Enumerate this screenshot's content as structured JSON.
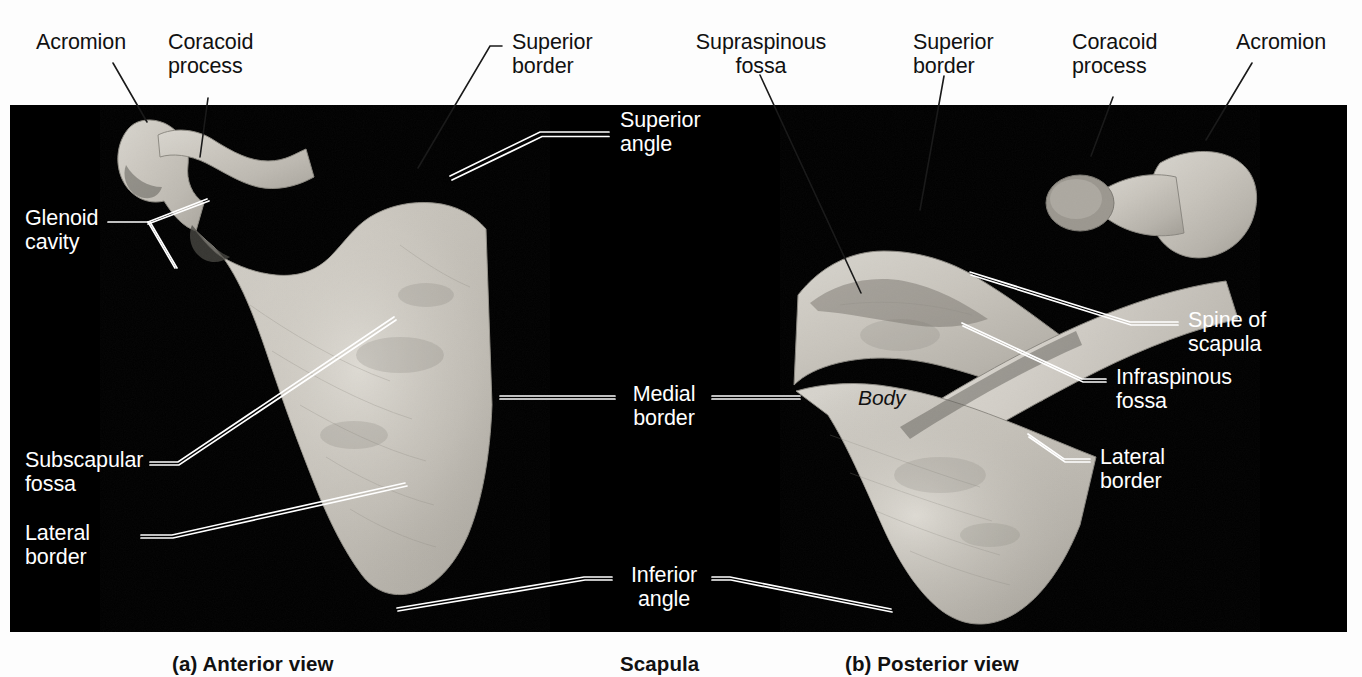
{
  "figure": {
    "title": "Scapula",
    "background_color": "#fdfdfd",
    "panel_color": "#000000",
    "bone_color": "#c9c5bd"
  },
  "captions": [
    {
      "key": "a",
      "text": "(a) Anterior view"
    },
    {
      "key": "center",
      "text": "Scapula"
    },
    {
      "key": "b",
      "text": "(b) Posterior view"
    }
  ],
  "labels": {
    "anterior": [
      {
        "id": "acromion-left",
        "text": "Acromion",
        "style": "dark"
      },
      {
        "id": "coracoid-process-left",
        "text": "Coracoid\nprocess",
        "style": "dark"
      },
      {
        "id": "superior-border-left",
        "text": "Superior\nborder",
        "style": "dark"
      },
      {
        "id": "superior-angle",
        "text": "Superior\nangle",
        "style": "light"
      },
      {
        "id": "glenoid-cavity",
        "text": "Glenoid\ncavity",
        "style": "light"
      },
      {
        "id": "subscapular-fossa",
        "text": "Subscapular\nfossa",
        "style": "light"
      },
      {
        "id": "lateral-border-left",
        "text": "Lateral\nborder",
        "style": "light"
      }
    ],
    "shared": [
      {
        "id": "medial-border",
        "text": "Medial\nborder",
        "style": "light"
      },
      {
        "id": "inferior-angle",
        "text": "Inferior\nangle",
        "style": "light"
      }
    ],
    "posterior": [
      {
        "id": "supraspinous-fossa",
        "text": "Supraspinous\nfossa",
        "style": "dark"
      },
      {
        "id": "superior-border-right",
        "text": "Superior\nborder",
        "style": "dark"
      },
      {
        "id": "coracoid-process-right",
        "text": "Coracoid\nprocess",
        "style": "dark"
      },
      {
        "id": "acromion-right",
        "text": "Acromion",
        "style": "dark"
      },
      {
        "id": "spine-of-scapula",
        "text": "Spine of\nscapula",
        "style": "light"
      },
      {
        "id": "infraspinous-fossa",
        "text": "Infraspinous\nfossa",
        "style": "light"
      },
      {
        "id": "lateral-border-right",
        "text": "Lateral\nborder",
        "style": "light"
      },
      {
        "id": "body",
        "text": "Body",
        "style": "italic"
      }
    ]
  }
}
